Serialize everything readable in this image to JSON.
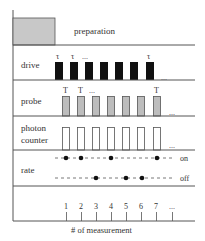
{
  "diagram": {
    "rows": {
      "preparation": {
        "label": "preparation"
      },
      "drive": {
        "label": "drive",
        "pulse_symbol": "τ",
        "ellipsis": "...",
        "fill": "#111111"
      },
      "probe": {
        "label": "probe",
        "pulse_symbol": "T",
        "ellipsis": "...",
        "fill": "#bdbdbd"
      },
      "photon_counter": {
        "label_line1": "photon",
        "label_line2": "counter",
        "ellipsis": "...",
        "fill": "#ffffff"
      },
      "rate": {
        "label": "rate",
        "on_label": "on",
        "off_label": "off"
      }
    },
    "axis": {
      "title": "# of measurement",
      "ticks": [
        "1",
        "2",
        "3",
        "4",
        "5",
        "6",
        "7",
        "..."
      ]
    },
    "rate_states": [
      {
        "measurement": 1,
        "state": "on"
      },
      {
        "measurement": 2,
        "state": "on"
      },
      {
        "measurement": 3,
        "state": "off"
      },
      {
        "measurement": 4,
        "state": "on"
      },
      {
        "measurement": 5,
        "state": "off"
      },
      {
        "measurement": 6,
        "state": "off"
      },
      {
        "measurement": 7,
        "state": "on"
      }
    ],
    "colors": {
      "line": "#555555",
      "preparation_fill": "#c8c8c8",
      "dot": "#111111"
    }
  }
}
